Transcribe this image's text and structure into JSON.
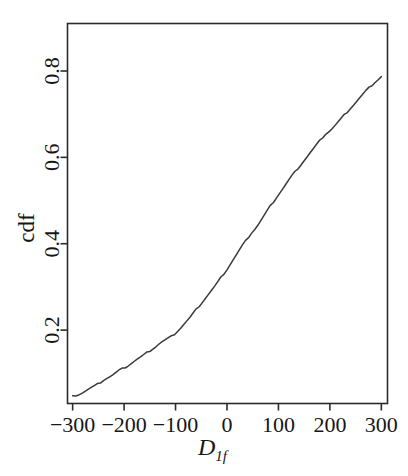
{
  "figure": {
    "background_color": "#ffffff",
    "line_color": "#3a3a3a",
    "axis_color": "#2b2b2b"
  },
  "chart_data": {
    "type": "line",
    "title": "",
    "subtitle": "",
    "xlabel": "D",
    "xlabel_subscript": "1f",
    "ylabel": "cdf",
    "xlim": [
      -310,
      312
    ],
    "ylim": [
      0.03,
      0.91
    ],
    "xticks": [
      -300,
      -200,
      -100,
      0,
      100,
      200,
      300
    ],
    "xticklabels": [
      "−300",
      "−200",
      "−100",
      "0",
      "100",
      "200",
      "300"
    ],
    "yticks": [
      0.2,
      0.4,
      0.6,
      0.8
    ],
    "yticklabels": [
      "0.2",
      "0.4",
      "0.6",
      "0.8"
    ],
    "grid": false,
    "legend": null,
    "series": [
      {
        "name": "empirical cdf",
        "x": [
          -300,
          -294,
          -288,
          -282,
          -276,
          -270,
          -264,
          -258,
          -252,
          -246,
          -240,
          -234,
          -228,
          -222,
          -216,
          -210,
          -204,
          -198,
          -192,
          -186,
          -180,
          -174,
          -168,
          -162,
          -156,
          -150,
          -144,
          -138,
          -132,
          -126,
          -120,
          -114,
          -108,
          -102,
          -96,
          -90,
          -84,
          -78,
          -72,
          -66,
          -60,
          -54,
          -48,
          -42,
          -36,
          -30,
          -24,
          -18,
          -12,
          -6,
          0,
          6,
          12,
          18,
          24,
          30,
          36,
          42,
          48,
          54,
          60,
          66,
          72,
          78,
          84,
          90,
          96,
          102,
          108,
          114,
          120,
          126,
          132,
          138,
          144,
          150,
          156,
          162,
          168,
          174,
          180,
          186,
          192,
          198,
          204,
          210,
          216,
          222,
          228,
          234,
          240,
          246,
          252,
          258,
          264,
          270,
          276,
          282,
          288,
          294,
          300
        ],
        "y": [
          0.048,
          0.049,
          0.051,
          0.054,
          0.058,
          0.062,
          0.066,
          0.07,
          0.074,
          0.079,
          0.084,
          0.088,
          0.092,
          0.096,
          0.101,
          0.106,
          0.11,
          0.114,
          0.118,
          0.123,
          0.128,
          0.133,
          0.137,
          0.142,
          0.147,
          0.152,
          0.157,
          0.162,
          0.168,
          0.173,
          0.177,
          0.181,
          0.185,
          0.191,
          0.198,
          0.205,
          0.213,
          0.221,
          0.229,
          0.238,
          0.247,
          0.256,
          0.265,
          0.274,
          0.283,
          0.292,
          0.301,
          0.311,
          0.321,
          0.331,
          0.341,
          0.352,
          0.363,
          0.374,
          0.385,
          0.396,
          0.406,
          0.416,
          0.426,
          0.434,
          0.443,
          0.454,
          0.465,
          0.476,
          0.487,
          0.497,
          0.507,
          0.517,
          0.527,
          0.537,
          0.547,
          0.557,
          0.566,
          0.575,
          0.584,
          0.593,
          0.602,
          0.611,
          0.62,
          0.629,
          0.638,
          0.647,
          0.655,
          0.66,
          0.666,
          0.674,
          0.682,
          0.69,
          0.698,
          0.706,
          0.714,
          0.722,
          0.73,
          0.738,
          0.746,
          0.754,
          0.761,
          0.768,
          0.775,
          0.781,
          0.787
        ]
      }
    ],
    "annotations": []
  }
}
